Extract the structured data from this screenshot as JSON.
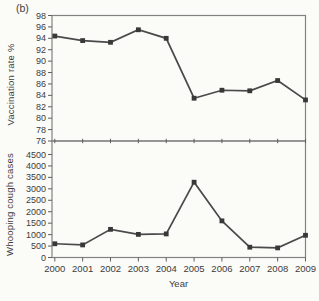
{
  "figure_label": "(b)",
  "colors": {
    "paper": "#fbfbf8",
    "axis": "#828282",
    "tick": "#5f5f5f",
    "text": "#3c3c3c",
    "line": "#4a4a4a",
    "marker": "#383838"
  },
  "chart_data": [
    {
      "type": "line",
      "panel": "top",
      "ylabel": "Vaccination rate %",
      "categories": [
        "2000",
        "2001",
        "2002",
        "2003",
        "2004",
        "2005",
        "2006",
        "2007",
        "2008",
        "2009"
      ],
      "values": [
        94.4,
        93.6,
        93.3,
        95.5,
        94.0,
        83.5,
        84.9,
        84.8,
        86.6,
        83.2
      ],
      "ylim": [
        76,
        98
      ],
      "yticks": [
        76,
        78,
        80,
        82,
        84,
        86,
        88,
        90,
        92,
        94,
        96,
        98
      ],
      "marker": "square",
      "grid": false,
      "legend": "none"
    },
    {
      "type": "line",
      "panel": "bottom",
      "ylabel": "Whooping cough cases",
      "xlabel": "Year",
      "categories": [
        "2000",
        "2001",
        "2002",
        "2003",
        "2004",
        "2005",
        "2006",
        "2007",
        "2008",
        "2009"
      ],
      "values": [
        600,
        550,
        1230,
        1010,
        1030,
        3290,
        1600,
        450,
        420,
        970
      ],
      "ylim": [
        0,
        5100
      ],
      "yticks": [
        0,
        500,
        1000,
        1500,
        2000,
        2500,
        3000,
        3500,
        4000,
        4500
      ],
      "marker": "square",
      "grid": false,
      "legend": "none"
    }
  ]
}
